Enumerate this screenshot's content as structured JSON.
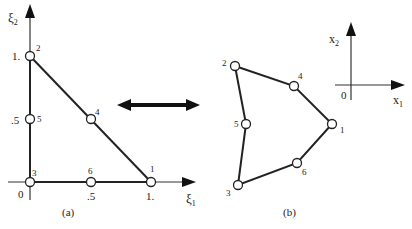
{
  "diagram": {
    "panel_a": {
      "caption": "(a)",
      "axis_x_label": "ξ",
      "axis_x_sub": "1",
      "axis_y_label": "ξ",
      "axis_y_sub": "2",
      "origin_label": "0",
      "ticks_x": [
        ".5",
        "1."
      ],
      "ticks_y": [
        ".5",
        "1."
      ],
      "nodes": [
        {
          "id": "1",
          "label": "1",
          "xi1": 1.0,
          "xi2": 0.0
        },
        {
          "id": "2",
          "label": "2",
          "xi1": 0.0,
          "xi2": 1.0
        },
        {
          "id": "3",
          "label": "3",
          "xi1": 0.0,
          "xi2": 0.0
        },
        {
          "id": "4",
          "label": "4",
          "xi1": 0.5,
          "xi2": 0.5
        },
        {
          "id": "5",
          "label": "5",
          "xi1": 0.0,
          "xi2": 0.5
        },
        {
          "id": "6",
          "label": "6",
          "xi1": 0.5,
          "xi2": 0.0
        }
      ]
    },
    "mapping_arrow": "double-headed-arrow",
    "panel_b": {
      "caption": "(b)",
      "axis_x_label": "x",
      "axis_x_sub": "1",
      "axis_y_label": "x",
      "axis_y_sub": "2",
      "origin_label": "0",
      "nodes": [
        {
          "id": "1",
          "label": "1"
        },
        {
          "id": "2",
          "label": "2"
        },
        {
          "id": "3",
          "label": "3"
        },
        {
          "id": "4",
          "label": "4"
        },
        {
          "id": "5",
          "label": "5"
        },
        {
          "id": "6",
          "label": "6"
        }
      ]
    }
  }
}
